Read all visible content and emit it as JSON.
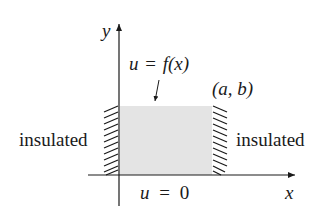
{
  "diagram": {
    "axes": {
      "x_label": "x",
      "y_label": "y"
    },
    "region": {
      "fill_color": "#e4e4e4",
      "corner_label": "(a, b)"
    },
    "boundaries": {
      "top": {
        "u": "u",
        "eq": "=",
        "f": "f(x)"
      },
      "bottom": {
        "u": "u",
        "eq": "=",
        "val": "0"
      },
      "left": "insulated",
      "right": "insulated"
    },
    "colors": {
      "ink": "#1a1a1a",
      "region_fill": "#e4e4e4"
    }
  }
}
